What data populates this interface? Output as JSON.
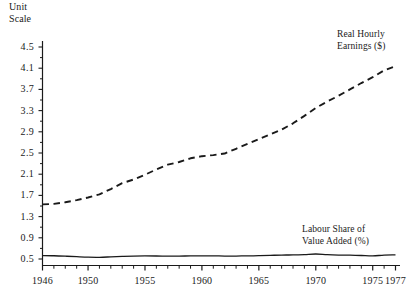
{
  "chart_data": {
    "type": "line",
    "title": "",
    "subtitle": "",
    "xlabel": "",
    "ylabel": "Unit Scale",
    "unit_scale_label_line1": "Unit",
    "unit_scale_label_line2": "Scale",
    "grid": false,
    "legend_position": "inline-annotations",
    "xlim": [
      1946,
      1977
    ],
    "ylim": [
      0.5,
      4.5
    ],
    "ytick_labels": [
      "4.5",
      "4.1",
      "3.7",
      "3.3",
      "2.9",
      "2.5",
      "2.1",
      "1.7",
      "1.3",
      "0.9",
      "0.5"
    ],
    "ytick_values": [
      4.5,
      4.1,
      3.7,
      3.3,
      2.9,
      2.5,
      2.1,
      1.7,
      1.3,
      0.9,
      0.5
    ],
    "ytick_minor_step": 0.2,
    "xtick_labels": [
      "1946",
      "1950",
      "1955",
      "1960",
      "1965",
      "1970",
      "1975",
      "1977"
    ],
    "xtick_label_values": [
      1946,
      1950,
      1955,
      1960,
      1965,
      1970,
      1975,
      1977
    ],
    "xtick_minor_step": 1,
    "x": [
      1946,
      1947,
      1948,
      1949,
      1950,
      1951,
      1952,
      1953,
      1954,
      1955,
      1956,
      1957,
      1958,
      1959,
      1960,
      1961,
      1962,
      1963,
      1964,
      1965,
      1966,
      1967,
      1968,
      1969,
      1970,
      1971,
      1972,
      1973,
      1974,
      1975,
      1976,
      1977
    ],
    "series": [
      {
        "name": "Real Hourly Earnings ($)",
        "annotation_line1": "Real Hourly",
        "annotation_line2": "Earnings ($)",
        "style": "dashed",
        "color": "#1a1a1a",
        "values": [
          1.53,
          1.54,
          1.57,
          1.61,
          1.66,
          1.72,
          1.82,
          1.93,
          2.0,
          2.09,
          2.19,
          2.28,
          2.33,
          2.4,
          2.44,
          2.46,
          2.49,
          2.58,
          2.67,
          2.76,
          2.85,
          2.94,
          3.06,
          3.2,
          3.35,
          3.47,
          3.58,
          3.7,
          3.82,
          3.93,
          4.06,
          4.14
        ]
      },
      {
        "name": "Labour Share of Value Added (%)",
        "annotation_line1": "Labour Share of",
        "annotation_line2": "Value Added (%)",
        "style": "solid",
        "color": "#1a1a1a",
        "values": [
          0.565,
          0.561,
          0.553,
          0.543,
          0.534,
          0.532,
          0.54,
          0.549,
          0.556,
          0.558,
          0.557,
          0.555,
          0.556,
          0.558,
          0.56,
          0.559,
          0.556,
          0.556,
          0.559,
          0.562,
          0.568,
          0.575,
          0.576,
          0.583,
          0.594,
          0.582,
          0.575,
          0.572,
          0.566,
          0.558,
          0.574,
          0.576
        ]
      }
    ]
  }
}
